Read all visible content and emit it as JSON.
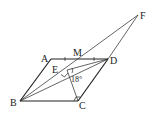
{
  "diagram": {
    "type": "geometry",
    "points": {
      "A": {
        "label": "A",
        "x": 51,
        "y": 59
      },
      "D": {
        "label": "D",
        "x": 108,
        "y": 59
      },
      "B": {
        "label": "B",
        "x": 20,
        "y": 101
      },
      "C": {
        "label": "C",
        "x": 78,
        "y": 101
      },
      "F": {
        "label": "F",
        "x": 138,
        "y": 15
      },
      "M": {
        "label": "M",
        "x": 79,
        "y": 59
      },
      "E": {
        "label": "E",
        "x": 67,
        "y": 70
      }
    },
    "angle_label": "18°",
    "line_color": "#222222"
  }
}
